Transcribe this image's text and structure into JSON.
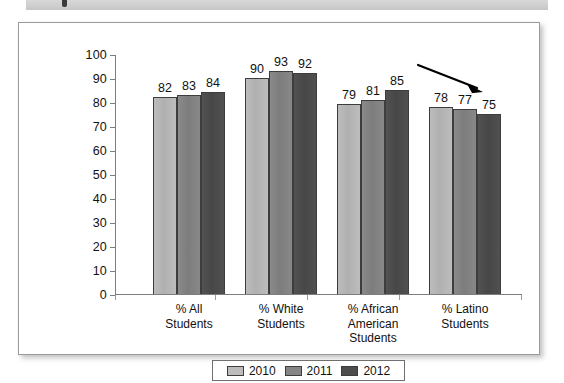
{
  "document": {
    "header_strip_label": "",
    "panel_name": "chart-figure-panel"
  },
  "chart_data": {
    "type": "bar",
    "title": "",
    "subtitle": "",
    "xlabel": "",
    "ylabel": "",
    "ylim": [
      0,
      100
    ],
    "ytick_step": 10,
    "yticks": [
      "100",
      "90",
      "80",
      "70",
      "60",
      "50",
      "40",
      "30",
      "20",
      "10",
      "0"
    ],
    "grid": false,
    "legend_position": "bottom-center",
    "categories": [
      "% All\nStudents",
      "% White\nStudents",
      "% African\nAmerican\nStudents",
      "% Latino\nStudents"
    ],
    "series": [
      {
        "name": "2010",
        "color": "#bcbcbc",
        "values": [
          82,
          90,
          79,
          78
        ]
      },
      {
        "name": "2011",
        "color": "#858585",
        "values": [
          83,
          93,
          81,
          77
        ]
      },
      {
        "name": "2012",
        "color": "#4d4d4d",
        "values": [
          84,
          92,
          85,
          75
        ]
      }
    ],
    "annotations": [
      {
        "kind": "arrow",
        "name": "downward-trend-arrow",
        "description": "black arrow pointing down and to the right above the % Latino Students group",
        "color": "#000000"
      }
    ]
  },
  "legend": {
    "items": [
      {
        "label": "2010",
        "color": "#bcbcbc"
      },
      {
        "label": "2011",
        "color": "#858585"
      },
      {
        "label": "2012",
        "color": "#4d4d4d"
      }
    ]
  }
}
